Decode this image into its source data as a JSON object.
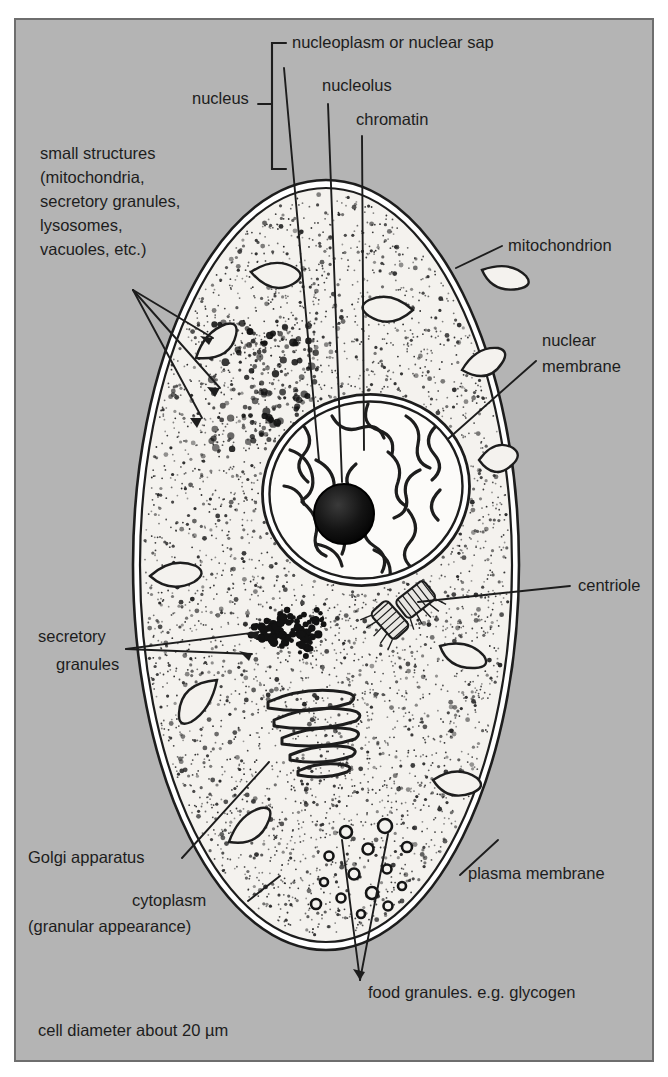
{
  "figure": {
    "type": "diagram",
    "caption": "cell diameter about 20 µm",
    "background_color": "#b4b4b4",
    "cell_fill_color": "#f4f2ee",
    "ink_color": "#1d1d1d"
  },
  "bracket": {
    "group_label": "nucleus"
  },
  "labels": {
    "nucleoplasm": "nucleoplasm or nuclear sap",
    "nucleolus": "nucleolus",
    "chromatin": "chromatin",
    "small_structures_l1": "small structures",
    "small_structures_l2": "(mitochondria,",
    "small_structures_l3": "secretory granules,",
    "small_structures_l4": "lysosomes,",
    "small_structures_l5": "vacuoles, etc.)",
    "mitochondrion": "mitochondrion",
    "nuclear_membrane_l1": "nuclear",
    "nuclear_membrane_l2": "membrane",
    "centriole": "centriole",
    "secretory_granules_l1": "secretory",
    "secretory_granules_l2": "granules",
    "golgi": "Golgi apparatus",
    "plasma_membrane": "plasma membrane",
    "cytoplasm_l1": "cytoplasm",
    "cytoplasm_l2": "(granular appearance)",
    "food_granules": "food granules. e.g. glycogen"
  },
  "organelles": [
    {
      "name": "nucleus",
      "shape": "large oval, centre of cell"
    },
    {
      "name": "nucleolus",
      "shape": "dark filled circle inside nucleus"
    },
    {
      "name": "chromatin",
      "shape": "squiggly threads inside nucleus"
    },
    {
      "name": "nuclear-membrane",
      "shape": "double outline around nucleus"
    },
    {
      "name": "mitochondrion",
      "shape": "elongated curved capsule",
      "count": 9
    },
    {
      "name": "centriole",
      "shape": "pair of short cylinders at right angles",
      "count": 2
    },
    {
      "name": "golgi-apparatus",
      "shape": "stack of flattened curved cisternae",
      "count": 5
    },
    {
      "name": "secretory-granules",
      "shape": "cluster of large dark dots"
    },
    {
      "name": "food-granules",
      "shape": "small rings, glycogen",
      "count": 14
    },
    {
      "name": "plasma-membrane",
      "shape": "double outline around whole cell"
    },
    {
      "name": "cytoplasm",
      "shape": "stippled granular interior"
    }
  ]
}
